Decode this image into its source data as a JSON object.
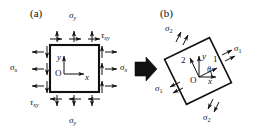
{
  "figure": {
    "background_color": "#ffffff",
    "ink_color": "#111111",
    "panels": [
      {
        "id": "a",
        "tag": "(a)",
        "description": "Square element aligned with x-y axes loaded by normal stresses sigma_x, sigma_y and shear stresses tau_xy",
        "element_shape": "square",
        "rotation_deg": 0,
        "origin_label": "O",
        "axes": [
          {
            "name": "x-axis",
            "label": "x",
            "direction": "right"
          },
          {
            "name": "y-axis",
            "label": "y",
            "direction": "up"
          }
        ],
        "stress_labels": [
          {
            "name": "sigma-y-top",
            "symbol": "σ",
            "subscript": "y",
            "position": "top"
          },
          {
            "name": "sigma-y-bottom",
            "symbol": "σ",
            "subscript": "y",
            "position": "bottom"
          },
          {
            "name": "sigma-x-left",
            "symbol": "σ",
            "subscript": "x",
            "position": "left"
          },
          {
            "name": "sigma-x-right",
            "symbol": "σ",
            "subscript": "x",
            "position": "right"
          },
          {
            "name": "tau-xy-top-right",
            "symbol": "τ",
            "subscript": "xy",
            "position": "top-right"
          },
          {
            "name": "tau-xy-bottom-left",
            "symbol": "τ",
            "subscript": "xy",
            "position": "bottom-left"
          }
        ]
      },
      {
        "id": "b",
        "tag": "(b)",
        "description": "Rotated element showing principal stresses sigma_1 and sigma_2 on the principal planes, principal axes 1 and 2 rotated by theta from x and y",
        "element_shape": "square",
        "rotation_deg": -26,
        "origin_label": "O",
        "axes": [
          {
            "name": "x-axis",
            "label": "x",
            "direction": "right"
          },
          {
            "name": "y-axis",
            "label": "y",
            "direction": "up"
          },
          {
            "name": "principal-axis-1",
            "label": "1",
            "direction": "rotated-right"
          },
          {
            "name": "principal-axis-2",
            "label": "2",
            "direction": "rotated-up"
          }
        ],
        "angle_label": {
          "name": "theta-angle",
          "symbol": "θ"
        },
        "stress_labels": [
          {
            "name": "sigma-1-right",
            "symbol": "σ",
            "subscript": "1",
            "position": "upper-right"
          },
          {
            "name": "sigma-1-left",
            "symbol": "σ",
            "subscript": "1",
            "position": "lower-left"
          },
          {
            "name": "sigma-2-top",
            "symbol": "σ",
            "subscript": "2",
            "position": "upper-left"
          },
          {
            "name": "sigma-2-bottom",
            "symbol": "σ",
            "subscript": "2",
            "position": "lower-right"
          }
        ]
      }
    ],
    "transition_arrow": {
      "name": "transition-arrow",
      "direction": "right"
    }
  }
}
